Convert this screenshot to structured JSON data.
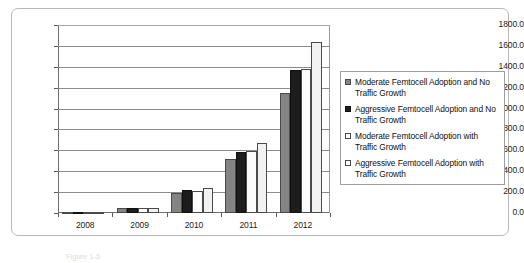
{
  "chart_data": {
    "type": "bar",
    "title": "",
    "xlabel": "",
    "ylabel": "",
    "categories": [
      "2008",
      "2009",
      "2010",
      "2011",
      "2012"
    ],
    "ylim": [
      0,
      1800
    ],
    "ytick_step": 200,
    "ytick_labels": [
      "1800.0",
      "1600.0",
      "1400.0",
      "1200.0",
      "1000.0",
      "800.0",
      "600.0",
      "400.0",
      "200.0",
      "0.0"
    ],
    "grid": true,
    "legend_position": "right",
    "series": [
      {
        "name": "Moderate Femtocell Adoption and No Traffic Growth",
        "color": "#848484",
        "values": [
          10,
          45,
          195,
          515,
          1150
        ]
      },
      {
        "name": "Aggressive Femtocell Adoption and No Traffic Growth",
        "color": "#1d1d1d",
        "values": [
          12,
          45,
          220,
          585,
          1370
        ]
      },
      {
        "name": "Moderate Femtocell Adoption with Traffic Growth",
        "color": "#ffffff",
        "values": [
          11,
          45,
          212,
          590,
          1375
        ]
      },
      {
        "name": "Aggressive Femtocell Adoption with Traffic Growth",
        "color": "#ffffff",
        "values": [
          13,
          52,
          238,
          670,
          1635
        ]
      }
    ]
  },
  "legend": {
    "items": [
      {
        "label": "Moderate Femtocell Adoption and No Traffic Growth"
      },
      {
        "label": "Aggressive Femtocell Adoption and No Traffic Growth"
      },
      {
        "label": "Moderate Femtocell Adoption with Traffic Growth"
      },
      {
        "label": "Aggressive Femtocell Adoption with Traffic Growth"
      }
    ]
  },
  "caption": {
    "text": "Figure 1-5"
  }
}
